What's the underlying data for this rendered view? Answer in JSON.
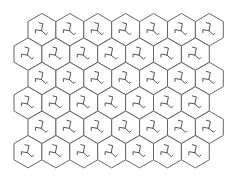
{
  "board": {
    "shape": "hexagonal-grid",
    "orientation": "pointy-top",
    "rows": 6,
    "cols": 7,
    "hex_width": 27.9,
    "hex_height": 32.4,
    "row_step": 24.4,
    "origin_y": 13.5,
    "row_offsets_x": [
      28,
      14,
      28,
      14,
      28,
      14
    ],
    "colors": {
      "background": "#ffffff",
      "outline": "#666666",
      "glyph": "#555555"
    },
    "tile_icon": "tripod-hook-icon"
  }
}
